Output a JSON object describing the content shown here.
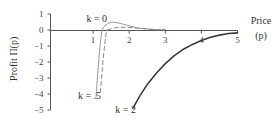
{
  "chart_data": {
    "type": "line",
    "title": "",
    "xlabel": "Price (p)",
    "xlabel_lines": [
      "Price",
      "(p)"
    ],
    "ylabel": "Profit Π(p)",
    "xlim": [
      0,
      5
    ],
    "ylim": [
      -5,
      1
    ],
    "x_ticks": [
      1,
      2,
      3,
      4,
      5
    ],
    "y_ticks": [
      1,
      0,
      -1,
      -2,
      -3,
      -4,
      -5
    ],
    "grid": false,
    "legend": "inline labels",
    "series": [
      {
        "name": "k = 0",
        "style": "solid-thin",
        "color": "#9a9a9a",
        "x": [
          1.08,
          1.12,
          1.16,
          1.2,
          1.25,
          1.3,
          1.4,
          1.5,
          1.6,
          1.7,
          1.8,
          2.0,
          2.2,
          2.4,
          2.6,
          2.8,
          3.0
        ],
        "y": [
          -4.2,
          -3.0,
          -1.8,
          -0.8,
          0.0,
          0.2,
          0.4,
          0.48,
          0.48,
          0.44,
          0.38,
          0.26,
          0.15,
          0.08,
          0.04,
          0.02,
          0.01
        ]
      },
      {
        "name": "k = .5",
        "style": "dashed",
        "color": "#8a8a8a",
        "x": [
          1.2,
          1.24,
          1.28,
          1.32,
          1.36,
          1.4,
          1.5,
          1.6,
          1.7,
          1.8,
          1.9,
          2.0,
          2.2,
          2.4,
          2.6,
          2.8,
          3.0
        ],
        "y": [
          -3.9,
          -2.8,
          -1.8,
          -0.9,
          -0.2,
          0.0,
          0.08,
          0.13,
          0.16,
          0.17,
          0.17,
          0.16,
          0.12,
          0.08,
          0.05,
          0.02,
          0.01
        ]
      },
      {
        "name": "k = 2",
        "style": "solid-thick",
        "color": "#3a3a3a",
        "x": [
          2.1,
          2.3,
          2.5,
          2.75,
          3.0,
          3.25,
          3.5,
          3.75,
          4.0,
          4.25,
          4.5,
          4.75,
          5.0
        ],
        "y": [
          -4.9,
          -4.1,
          -3.4,
          -2.7,
          -2.1,
          -1.6,
          -1.2,
          -0.9,
          -0.65,
          -0.45,
          -0.32,
          -0.22,
          -0.18
        ]
      }
    ],
    "annotations": [
      {
        "text": "k = 0",
        "x": 1.1,
        "y": 0.5
      },
      {
        "text": "k = .5",
        "x": 0.9,
        "y": -4.3
      },
      {
        "text": "k = 2",
        "x": 1.9,
        "y": -5.2
      }
    ]
  }
}
